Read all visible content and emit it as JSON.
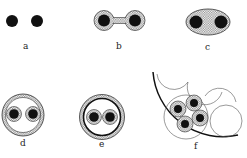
{
  "figure": {
    "panels": [
      {
        "id": "a",
        "label": "a",
        "description": "Two separate black dots"
      },
      {
        "id": "b",
        "label": "b",
        "description": "Two dots in hatched sheaths joined by hatched bridge"
      },
      {
        "id": "c",
        "label": "c",
        "description": "Two dots enclosed in one hatched ellipse"
      },
      {
        "id": "d",
        "label": "d",
        "description": "Two sheathed dots inside a hatched ring"
      },
      {
        "id": "e",
        "label": "e",
        "description": "Two sheathed dots inside a thick black ring with hatched border"
      },
      {
        "id": "f",
        "label": "f",
        "description": "Cluster of four sheathed dots packed inside a large arc with tangent circles"
      }
    ]
  },
  "colors": {
    "ink": "#111111",
    "hatch": "#9a9a9a",
    "background": "#ffffff"
  }
}
